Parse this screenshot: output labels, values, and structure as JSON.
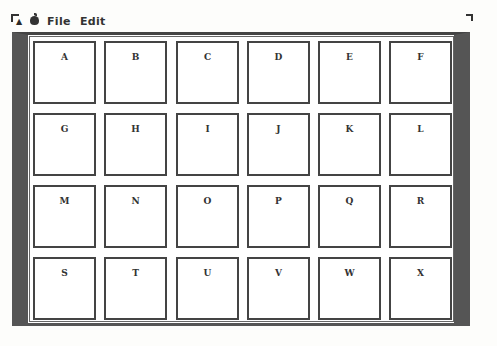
{
  "menubar": {
    "items": [
      {
        "label": "File"
      },
      {
        "label": "Edit"
      }
    ]
  },
  "grid": {
    "rows": 4,
    "columns": 6,
    "cells": [
      "A",
      "B",
      "C",
      "D",
      "E",
      "F",
      "G",
      "H",
      "I",
      "J",
      "K",
      "L",
      "M",
      "N",
      "O",
      "P",
      "Q",
      "R",
      "S",
      "T",
      "U",
      "V",
      "W",
      "X"
    ]
  },
  "colors": {
    "frame": "#555555",
    "cell_border": "#444444",
    "background": "#fdfdfb"
  }
}
